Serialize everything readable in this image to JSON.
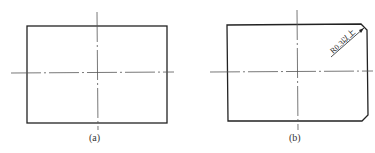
{
  "figures": [
    {
      "id": "a",
      "caption": "(a)",
      "shape": "rectangle",
      "corners": "sharp"
    },
    {
      "id": "b",
      "caption": "(b)",
      "shape": "rectangle",
      "corners": "chamfered right corners",
      "annotation": "R0.3以上"
    }
  ],
  "colors": {
    "outline": "#222222",
    "centerline": "#555555",
    "background": "#ffffff"
  }
}
